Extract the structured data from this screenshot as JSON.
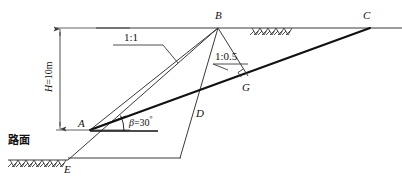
{
  "figure": {
    "colors": {
      "line": "#3a3a3a",
      "thick_line": "#111111",
      "text": "#111111",
      "background": "#ffffff"
    },
    "points": [
      {
        "id": "A",
        "label": "A",
        "x": 90,
        "y": 130,
        "label_x": 78,
        "label_y": 120
      },
      {
        "id": "B",
        "label": "B",
        "x": 218,
        "y": 28,
        "label_x": 215,
        "label_y": 12
      },
      {
        "id": "C",
        "label": "C",
        "x": 370,
        "y": 28,
        "label_x": 364,
        "label_y": 12
      },
      {
        "id": "D",
        "label": "D",
        "x": 190,
        "y": 106,
        "label_x": 196,
        "label_y": 110
      },
      {
        "id": "E",
        "label": "E",
        "x": 68,
        "y": 160,
        "label_x": 66,
        "label_y": 166
      },
      {
        "id": "G",
        "label": "G",
        "x": 245,
        "y": 78,
        "label_x": 243,
        "label_y": 84
      }
    ],
    "annotations": {
      "slope_ratio_upper": "1:1",
      "slope_ratio_lower": "1:0.5",
      "angle": "=30",
      "angle_symbol": "β",
      "angle_value": "30º",
      "height": "=10m",
      "height_symbol": "H",
      "road_surface": "路面"
    },
    "dimension": {
      "label": "H=10m",
      "top_y": 28,
      "bottom_y": 130,
      "x": 60
    }
  }
}
